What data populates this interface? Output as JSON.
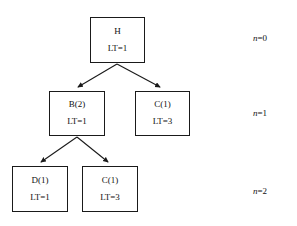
{
  "diagram": {
    "title": "",
    "nodes": [
      {
        "id": "root",
        "label": "H",
        "lt": "LT=1",
        "level": 0
      },
      {
        "id": "b2",
        "label": "B(2)",
        "lt": "LT=1",
        "level": 1
      },
      {
        "id": "c1_level1",
        "label": "C(1)",
        "lt": "LT=3",
        "level": 1
      },
      {
        "id": "d1",
        "label": "D(1)",
        "lt": "LT=1",
        "level": 2
      },
      {
        "id": "c1_level2",
        "label": "C(1)",
        "lt": "LT=3",
        "level": 2
      }
    ],
    "edges": [
      {
        "from": "root",
        "to": "b2"
      },
      {
        "from": "root",
        "to": "c1_level1"
      },
      {
        "from": "b2",
        "to": "d1"
      },
      {
        "from": "b2",
        "to": "c1_level2"
      }
    ],
    "level_labels": [
      {
        "prefix": "n",
        "eq": "=0"
      },
      {
        "prefix": "n",
        "eq": "=1"
      },
      {
        "prefix": "n",
        "eq": "=2"
      }
    ],
    "colors": {
      "stroke": "#1a1a1a",
      "text": "#111111",
      "background": "#ffffff"
    }
  }
}
